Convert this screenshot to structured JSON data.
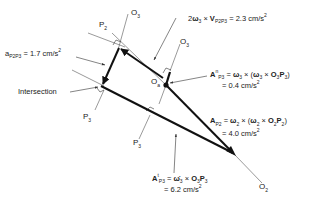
{
  "diagram": {
    "type": "acceleration polygon (kinematics vector diagram)",
    "points": {
      "P2_label": "P",
      "P2_sub": "2",
      "O3_top_label": "O",
      "O3_top_sub": "3",
      "O3_right_label": "O",
      "O3_right_sub": "3",
      "Oa_label": "O",
      "Oa_sub": "a",
      "P3_left_label": "P",
      "P3_left_sub": "3",
      "P3_mid_label": "P",
      "P3_mid_sub": "3",
      "O2_label": "O",
      "O2_sub": "2",
      "intersection_label": "Intersection"
    },
    "vectors": {
      "coriolis": {
        "prefix": "2",
        "omega": "ω",
        "omega_sub": "3",
        "cross": " × ",
        "V": "V",
        "V_sub": "P2P3",
        "value": " = 2.3 cm/s",
        "unit_sup": "2"
      },
      "a_p2p3": {
        "a": "a",
        "a_sub": "P2P3",
        "value": " = 1.7 cm/s",
        "unit_sup": "2"
      },
      "normal_p3": {
        "A": "A",
        "A_sup": "n",
        "A_sub": "P3",
        "expr_eq": " = ",
        "omega1": "ω",
        "omega1_sub": "3",
        "cross1": " × (",
        "omega2": "ω",
        "omega2_sub": "3",
        "cross2": " × ",
        "O": "O",
        "O_sub": "3",
        "P": "P",
        "P_sub": "3",
        "close": ")",
        "value": "= 0.4 cm/s",
        "unit_sup": "2"
      },
      "ap2": {
        "A": "A",
        "A_sub": "P2",
        "expr_eq": " = ",
        "omega1": "ω",
        "omega1_sub": "2",
        "cross1": " × (",
        "omega2": "ω",
        "omega2_sub": "2",
        "cross2": " × ",
        "O": "O",
        "O_sub": "2",
        "P": "P",
        "P_sub": "2",
        "close": ")",
        "value": "= 4.0 cm/s",
        "unit_sup": "2"
      },
      "tangential_p3": {
        "A": "A",
        "A_sup": "t",
        "A_sub": "P3",
        "expr_eq": " = ",
        "omega": "ω̇",
        "omega_sub": "3",
        "cross": " × ",
        "O": "O",
        "O_sub": "3",
        "P": "P",
        "P_sub": "3",
        "value": "= 6.2 cm/s",
        "unit_sup": "2"
      }
    },
    "colors": {
      "line": "#111111",
      "thin_line": "#444444",
      "text": "#222222",
      "background": "#ffffff"
    }
  }
}
